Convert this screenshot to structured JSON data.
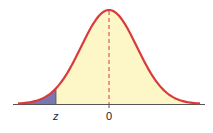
{
  "diagram": {
    "type": "normal-distribution-curve",
    "shaded_region": "left-tail",
    "labels": {
      "z": "z",
      "zero": "0"
    },
    "colors": {
      "curve": "#d93a3a",
      "fill": "#fdf7c8",
      "shaded": "#7777b4",
      "axis": "#555555",
      "dashed_line": "#d93a3a"
    }
  }
}
